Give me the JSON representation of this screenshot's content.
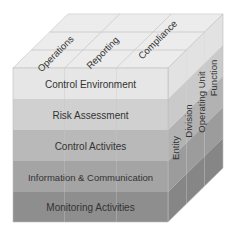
{
  "diagram": {
    "type": "coso-cube",
    "top_face": {
      "labels": [
        "Operations",
        "Reporting",
        "Compliance"
      ]
    },
    "front_face": {
      "rows": [
        {
          "label": "Control Environment",
          "color": "#e6e6e6"
        },
        {
          "label": "Risk Assessment",
          "color": "#d0d0d0"
        },
        {
          "label": "Control Activites",
          "color": "#b9b9b9"
        },
        {
          "label": "Information & Communication",
          "color": "#a4a4a4"
        },
        {
          "label": "Monitoring Activities",
          "color": "#8e8e8e"
        }
      ]
    },
    "side_face": {
      "labels": [
        "Entity",
        "Division",
        "Operating Unit",
        "Function"
      ]
    },
    "colors": {
      "top": "#ececec",
      "edge": "#ffffff",
      "text": "#333333"
    }
  }
}
